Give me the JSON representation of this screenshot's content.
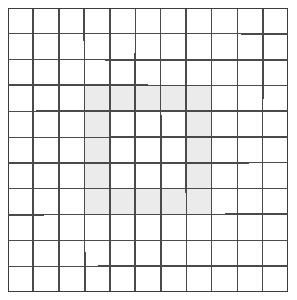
{
  "figure": {
    "name": "grid-shaded-ring",
    "type": "pixel-grid",
    "rows": 11,
    "columns": 11,
    "cell_width": 25.45,
    "cell_height": 25.82,
    "origin_x": 8,
    "origin_y": 8
  },
  "colors": {
    "background": "#ffffff",
    "grid_line": "#4a4a4a",
    "grid_line_soft": "#6e6e6e",
    "cell_empty": "#ffffff",
    "cell_shaded": "#ebebeb",
    "outer_border": "#3c3c3c"
  },
  "style": {
    "grid_line_width": 1.6,
    "outer_border_width": 1.8
  },
  "shaded_cells": [
    {
      "row": 4,
      "col": 4
    },
    {
      "row": 4,
      "col": 5
    },
    {
      "row": 4,
      "col": 6
    },
    {
      "row": 4,
      "col": 7
    },
    {
      "row": 4,
      "col": 8
    },
    {
      "row": 5,
      "col": 4
    },
    {
      "row": 5,
      "col": 8
    },
    {
      "row": 6,
      "col": 4
    },
    {
      "row": 6,
      "col": 8
    },
    {
      "row": 7,
      "col": 4
    },
    {
      "row": 7,
      "col": 8
    },
    {
      "row": 8,
      "col": 4
    },
    {
      "row": 8,
      "col": 5
    },
    {
      "row": 8,
      "col": 6
    },
    {
      "row": 8,
      "col": 7
    },
    {
      "row": 8,
      "col": 8
    }
  ],
  "shape_summary": {
    "name": "hollow-square-ring",
    "bounding_rows": [
      4,
      8
    ],
    "bounding_columns": [
      4,
      8
    ],
    "shaded_count": 16,
    "hole_rows": [
      5,
      7
    ],
    "hole_columns": [
      5,
      7
    ],
    "hole_count": 9
  },
  "chart_data": {
    "type": "heatmap",
    "title": "",
    "xlabel": "",
    "ylabel": "",
    "x": [
      1,
      2,
      3,
      4,
      5,
      6,
      7,
      8,
      9,
      10,
      11
    ],
    "y": [
      1,
      2,
      3,
      4,
      5,
      6,
      7,
      8,
      9,
      10,
      11
    ],
    "grid": true,
    "legend": "none",
    "values": [
      [
        0,
        0,
        0,
        0,
        0,
        0,
        0,
        0,
        0,
        0,
        0
      ],
      [
        0,
        0,
        0,
        0,
        0,
        0,
        0,
        0,
        0,
        0,
        0
      ],
      [
        0,
        0,
        0,
        0,
        0,
        0,
        0,
        0,
        0,
        0,
        0
      ],
      [
        0,
        0,
        0,
        1,
        1,
        1,
        1,
        1,
        0,
        0,
        0
      ],
      [
        0,
        0,
        0,
        1,
        0,
        0,
        0,
        1,
        0,
        0,
        0
      ],
      [
        0,
        0,
        0,
        1,
        0,
        0,
        0,
        1,
        0,
        0,
        0
      ],
      [
        0,
        0,
        0,
        1,
        0,
        0,
        0,
        1,
        0,
        0,
        0
      ],
      [
        0,
        0,
        0,
        1,
        1,
        1,
        1,
        1,
        0,
        0,
        0
      ],
      [
        0,
        0,
        0,
        0,
        0,
        0,
        0,
        0,
        0,
        0,
        0
      ],
      [
        0,
        0,
        0,
        0,
        0,
        0,
        0,
        0,
        0,
        0,
        0
      ],
      [
        0,
        0,
        0,
        0,
        0,
        0,
        0,
        0,
        0,
        0,
        0
      ]
    ]
  }
}
